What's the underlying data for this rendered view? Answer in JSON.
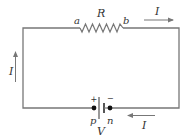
{
  "diagram": {
    "colors": {
      "wire": "#777777",
      "text": "#333333",
      "terminal": "#111111"
    },
    "resistor": {
      "label": "R",
      "terminal_left": "a",
      "terminal_right": "b"
    },
    "battery": {
      "label": "V",
      "positive_sign": "+",
      "negative_sign": "−",
      "terminal_positive": "p",
      "terminal_negative": "n"
    },
    "currents": [
      {
        "id": "top",
        "label": "I",
        "direction": "right"
      },
      {
        "id": "left",
        "label": "I",
        "direction": "up"
      },
      {
        "id": "bottom",
        "label": "I",
        "direction": "left"
      }
    ]
  }
}
